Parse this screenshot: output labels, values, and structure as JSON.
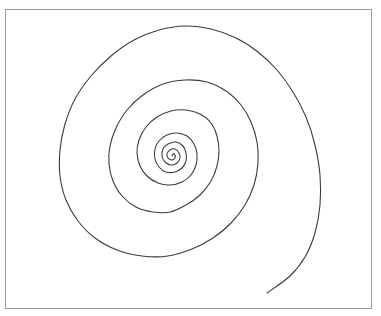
{
  "canvas": {
    "width": 381,
    "height": 316,
    "background": "#ffffff"
  },
  "frame": {
    "x": 5,
    "y": 9,
    "width": 367,
    "height": 300,
    "border_color": "#9a9a9a"
  },
  "spiral": {
    "stroke_color": "#3c3c3c",
    "stroke_width": 1.1,
    "center": [
      172,
      156
    ],
    "points": [
      [
        172,
        156
      ],
      [
        173,
        154
      ],
      [
        175,
        155
      ],
      [
        175,
        158
      ],
      [
        172,
        160
      ],
      [
        168,
        158
      ],
      [
        167,
        154
      ],
      [
        170,
        150
      ],
      [
        175,
        149
      ],
      [
        179,
        153
      ],
      [
        180,
        158
      ],
      [
        177,
        163
      ],
      [
        171,
        165
      ],
      [
        165,
        162
      ],
      [
        162,
        156
      ],
      [
        163,
        149
      ],
      [
        168,
        144
      ],
      [
        176,
        142
      ],
      [
        183,
        146
      ],
      [
        186,
        153
      ],
      [
        186,
        161
      ],
      [
        182,
        168
      ],
      [
        175,
        172
      ],
      [
        166,
        172
      ],
      [
        159,
        167
      ],
      [
        155,
        159
      ],
      [
        155,
        149
      ],
      [
        159,
        141
      ],
      [
        167,
        135
      ],
      [
        177,
        133
      ],
      [
        187,
        136
      ],
      [
        194,
        144
      ],
      [
        197,
        154
      ],
      [
        196,
        165
      ],
      [
        191,
        175
      ],
      [
        182,
        182
      ],
      [
        170,
        185
      ],
      [
        158,
        183
      ],
      [
        147,
        176
      ],
      [
        140,
        166
      ],
      [
        137,
        153
      ],
      [
        139,
        140
      ],
      [
        146,
        127
      ],
      [
        157,
        117
      ],
      [
        171,
        111
      ],
      [
        186,
        110
      ],
      [
        200,
        114
      ],
      [
        211,
        123
      ],
      [
        217,
        136
      ],
      [
        219,
        151
      ],
      [
        217,
        166
      ],
      [
        211,
        181
      ],
      [
        200,
        195
      ],
      [
        186,
        205
      ],
      [
        170,
        212
      ],
      [
        153,
        212
      ],
      [
        136,
        207
      ],
      [
        122,
        196
      ],
      [
        113,
        181
      ],
      [
        109,
        164
      ],
      [
        110,
        146
      ],
      [
        116,
        128
      ],
      [
        127,
        110
      ],
      [
        143,
        95
      ],
      [
        163,
        84
      ],
      [
        185,
        80
      ],
      [
        207,
        82
      ],
      [
        226,
        91
      ],
      [
        241,
        105
      ],
      [
        251,
        122
      ],
      [
        257,
        142
      ],
      [
        258,
        163
      ],
      [
        254,
        185
      ],
      [
        245,
        205
      ],
      [
        231,
        223
      ],
      [
        213,
        238
      ],
      [
        192,
        249
      ],
      [
        168,
        256
      ],
      [
        142,
        256
      ],
      [
        117,
        250
      ],
      [
        95,
        238
      ],
      [
        78,
        221
      ],
      [
        66,
        200
      ],
      [
        60,
        176
      ],
      [
        60,
        150
      ],
      [
        65,
        124
      ],
      [
        75,
        99
      ],
      [
        91,
        76
      ],
      [
        111,
        56
      ],
      [
        134,
        40
      ],
      [
        159,
        30
      ],
      [
        185,
        26
      ],
      [
        211,
        29
      ],
      [
        236,
        38
      ],
      [
        258,
        52
      ],
      [
        277,
        70
      ],
      [
        293,
        92
      ],
      [
        306,
        117
      ],
      [
        315,
        145
      ],
      [
        320,
        175
      ],
      [
        320,
        205
      ],
      [
        315,
        233
      ],
      [
        305,
        257
      ],
      [
        290,
        276
      ],
      [
        267,
        293
      ]
    ]
  }
}
